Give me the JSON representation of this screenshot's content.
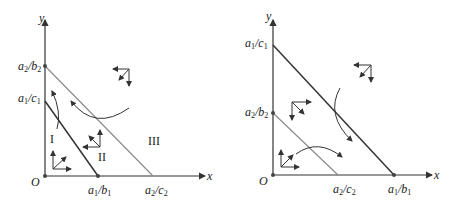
{
  "left_panel": {
    "axis_x": "x",
    "axis_y": "y",
    "origin": "O",
    "y_ticks": [
      {
        "num": "a",
        "num_sub": "2",
        "den": "b",
        "den_sub": "2"
      },
      {
        "num": "a",
        "num_sub": "1",
        "den": "c",
        "den_sub": "1"
      }
    ],
    "x_ticks": [
      {
        "num": "a",
        "num_sub": "1",
        "den": "b",
        "den_sub": "1"
      },
      {
        "num": "a",
        "num_sub": "2",
        "den": "c",
        "den_sub": "2"
      }
    ],
    "regions": [
      "I",
      "II",
      "III"
    ]
  },
  "right_panel": {
    "axis_x": "x",
    "axis_y": "y",
    "origin": "O",
    "y_ticks": [
      {
        "num": "a",
        "num_sub": "1",
        "den": "c",
        "den_sub": "1"
      },
      {
        "num": "a",
        "num_sub": "2",
        "den": "b",
        "den_sub": "2"
      }
    ],
    "x_ticks": [
      {
        "num": "a",
        "num_sub": "2",
        "den": "c",
        "den_sub": "2"
      },
      {
        "num": "a",
        "num_sub": "1",
        "den": "b",
        "den_sub": "1"
      }
    ]
  },
  "colors": {
    "line": "#333333",
    "line_light": "#666666"
  }
}
